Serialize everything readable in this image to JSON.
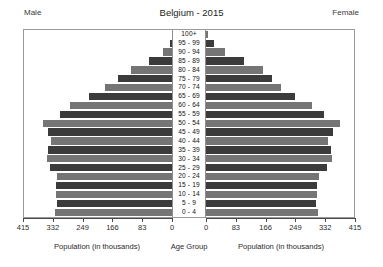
{
  "header": {
    "title": "Belgium - 2015",
    "male_label": "Male",
    "female_label": "Female"
  },
  "axis": {
    "left_title": "Population (in thousands)",
    "center_title": "Age Group",
    "right_title": "Population (in thousands)",
    "ticks_left": [
      "415",
      "332",
      "249",
      "166",
      "83",
      "0"
    ],
    "ticks_right": [
      "0",
      "83",
      "166",
      "249",
      "332",
      "415"
    ]
  },
  "colors": {
    "bar_dark": "#3b3b3b",
    "bar_mid": "#757575",
    "frame": "#9a9a9a",
    "axis": "#4a4a4a",
    "background": "#ffffff"
  },
  "chart_data": {
    "type": "bar",
    "subtype": "population-pyramid",
    "title": "Belgium - 2015",
    "xlabel": "Population (in thousands)",
    "ylabel": "Age Group",
    "xlim": [
      0,
      415
    ],
    "xticks": [
      0,
      83,
      166,
      249,
      332,
      415
    ],
    "grid": false,
    "legend": [
      "Male",
      "Female"
    ],
    "legend_position": "top-corners",
    "categories": [
      "100+",
      "95 - 99",
      "90 - 94",
      "85 - 89",
      "80 - 84",
      "75 - 79",
      "70 - 74",
      "65 - 69",
      "60 - 64",
      "55 - 59",
      "50 - 54",
      "45 - 49",
      "40 - 44",
      "35 - 39",
      "30 - 34",
      "25 - 29",
      "20 - 24",
      "15 - 19",
      "10 - 14",
      "5 - 9",
      "0 - 4"
    ],
    "series": [
      {
        "name": "Male",
        "side": "left",
        "values": [
          1,
          7,
          24,
          63,
          113,
          150,
          186,
          230,
          283,
          312,
          360,
          345,
          337,
          345,
          349,
          340,
          320,
          322,
          324,
          320,
          327
        ]
      },
      {
        "name": "Female",
        "side": "right",
        "values": [
          5,
          21,
          52,
          105,
          159,
          183,
          210,
          248,
          296,
          330,
          372,
          353,
          341,
          348,
          350,
          338,
          316,
          309,
          309,
          306,
          312
        ]
      }
    ]
  }
}
